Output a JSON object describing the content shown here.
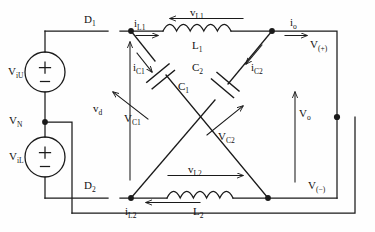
{
  "diagram": {
    "type": "electrical-schematic",
    "stroke_color": "#1a1a1a",
    "background_color": "#fefefe"
  },
  "sources": [
    {
      "id": "viu",
      "label": "V",
      "sub": "iU",
      "plus": "+",
      "minus": "−"
    },
    {
      "id": "vil",
      "label": "V",
      "sub": "iL",
      "plus": "+",
      "minus": "−"
    }
  ],
  "nodes": {
    "vn": {
      "label": "V",
      "sub": "N"
    },
    "vplus": {
      "label": "V",
      "sub": "(+)"
    },
    "vminus": {
      "label": "V",
      "sub": "(−)"
    }
  },
  "switches": [
    {
      "id": "d1",
      "label": "D",
      "sub": "1"
    },
    {
      "id": "d2",
      "label": "D",
      "sub": "2"
    }
  ],
  "inductors": [
    {
      "id": "l1",
      "label": "L",
      "sub": "1"
    },
    {
      "id": "l2",
      "label": "L",
      "sub": "2"
    }
  ],
  "capacitors": [
    {
      "id": "c1",
      "label": "C",
      "sub": "1"
    },
    {
      "id": "c2",
      "label": "C",
      "sub": "2"
    }
  ],
  "currents": [
    {
      "id": "il1",
      "label": "i",
      "sub": "L1"
    },
    {
      "id": "il2",
      "label": "i",
      "sub": "L2"
    },
    {
      "id": "ic1",
      "label": "i",
      "sub": "C1"
    },
    {
      "id": "ic2",
      "label": "i",
      "sub": "C2"
    },
    {
      "id": "io",
      "label": "i",
      "sub": "o"
    }
  ],
  "voltages": [
    {
      "id": "vl1",
      "label": "v",
      "sub": "L1"
    },
    {
      "id": "vl2",
      "label": "v",
      "sub": "L2"
    },
    {
      "id": "vc1",
      "label": "V",
      "sub": "C1"
    },
    {
      "id": "vc2",
      "label": "V",
      "sub": "C2"
    },
    {
      "id": "vd",
      "label": "v",
      "sub": "d"
    },
    {
      "id": "vo",
      "label": "V",
      "sub": "o"
    }
  ]
}
